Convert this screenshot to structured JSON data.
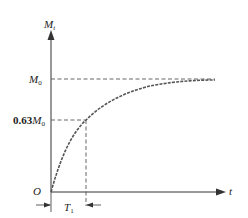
{
  "diagram": {
    "type": "step_response_curve",
    "y_axis_label": {
      "main": "M",
      "sub": "t"
    },
    "x_axis_label": "t",
    "origin_label": "O",
    "levels": [
      {
        "name": "final_value",
        "label_main": "M",
        "label_sub": "0",
        "label_prefix": ""
      },
      {
        "name": "time_constant_value",
        "label_main": "M",
        "label_sub": "0",
        "label_prefix": "0.63"
      }
    ],
    "time_constant_label": {
      "main": "T",
      "sub": "1"
    },
    "curve": "M_t = M_0 (1 - e^(-t/T_1))",
    "colors": {
      "axis": "#333333",
      "dashed": "#555555",
      "curve": "#555555",
      "text": "#222222"
    }
  }
}
